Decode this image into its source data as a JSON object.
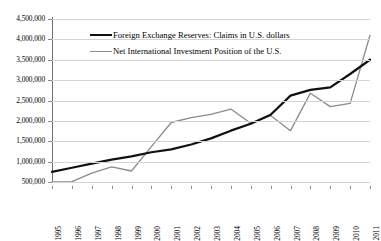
{
  "chart_data": {
    "type": "line",
    "title": "",
    "xlabel": "",
    "ylabel": "",
    "grid": true,
    "legend_position": "top-left-inside",
    "ylim": [
      0,
      4500000
    ],
    "yticks": [
      "500,000",
      "1,000,000",
      "1,500,000",
      "2,000,000",
      "2,500,000",
      "3,000,000",
      "3,500,000",
      "4,000,000",
      "4,500,000"
    ],
    "ytick_values": [
      500000,
      1000000,
      1500000,
      2000000,
      2500000,
      3000000,
      3500000,
      4000000,
      4500000
    ],
    "categories": [
      "1995",
      "1996",
      "1997",
      "1998",
      "1999",
      "2000",
      "2001",
      "2002",
      "2003",
      "2004",
      "2005",
      "2006",
      "2007",
      "2008",
      "2009",
      "2010",
      "2011"
    ],
    "series": [
      {
        "name": "Foreign Exchange Reserves: Claims in U.S. dollars",
        "color": "#111111",
        "width": 2.2,
        "values": [
          750000,
          850000,
          950000,
          1050000,
          1130000,
          1230000,
          1300000,
          1420000,
          1570000,
          1760000,
          1930000,
          2150000,
          2620000,
          2760000,
          2820000,
          3150000,
          3500000
        ]
      },
      {
        "name": "Net International Investment Position of the U.S.",
        "color": "#8b8b8b",
        "width": 1.3,
        "values": [
          500000,
          510000,
          720000,
          870000,
          770000,
          1370000,
          1960000,
          2080000,
          2160000,
          2290000,
          1940000,
          2130000,
          1760000,
          2680000,
          2350000,
          2430000,
          4100000
        ]
      }
    ]
  },
  "legend": {
    "entries": [
      {
        "label": "Foreign Exchange Reserves: Claims in U.S. dollars"
      },
      {
        "label": "Net International Investment Position of the U.S."
      }
    ]
  },
  "caption": {
    "text": ""
  }
}
